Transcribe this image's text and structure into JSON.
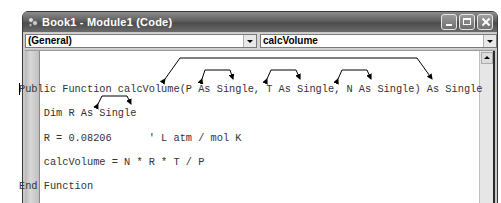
{
  "window": {
    "title": "Book1 - Module1 (Code)",
    "controls": [
      "minimize",
      "maximize",
      "close"
    ]
  },
  "combos": {
    "object": {
      "value": "(General)"
    },
    "procedure": {
      "value": "calcVolume"
    }
  },
  "code": {
    "lines": [
      "Public Function calcVolume(P As Single, T As Single, N As Single) As Single",
      "    Dim R As Single",
      "    R = 0.08206      ' L atm / mol K",
      "    calcVolume = N * R * T / P",
      "End Function"
    ]
  },
  "annotations": {
    "arrows": [
      "bracket arrow from function-name/return-type connector to calcVolume",
      "bracket arrow from connector to return type As Single",
      "bracket arrows over P As Single",
      "bracket arrows over T As Single",
      "bracket arrows over N As Single",
      "bracket arrows over R in Dim R As Single"
    ]
  }
}
